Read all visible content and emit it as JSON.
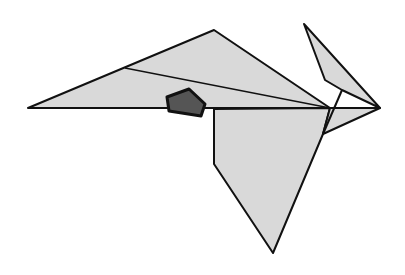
{
  "figure": {
    "title": "",
    "colors": {
      "fill": "#d9d9d9",
      "stroke": "#111111",
      "accent": "#555555",
      "background": "#ffffff"
    },
    "pieces": [
      {
        "name": "upper-wing-triangle",
        "points": "28,108 214,30 330,108"
      },
      {
        "name": "lower-body-polygon",
        "points": "214,110 330,108 323,134 273,253 214,164"
      },
      {
        "name": "ear-piece",
        "points": "304,24 380,108 342,90 325,80"
      },
      {
        "name": "beak-triangle",
        "points": "330,108 380,108 323,134"
      },
      {
        "name": "dark-house",
        "points": "163,95 189,88 205,103 201,117 168,112"
      }
    ],
    "lines": [
      {
        "name": "wing-inner-line",
        "x1": 125,
        "y1": 68,
        "x2": 330,
        "y2": 108
      },
      {
        "name": "horizontal-spine",
        "x1": 28,
        "y1": 108,
        "x2": 380,
        "y2": 108
      },
      {
        "name": "ear-inner-line",
        "x1": 342,
        "y1": 90,
        "x2": 323,
        "y2": 134
      }
    ]
  }
}
